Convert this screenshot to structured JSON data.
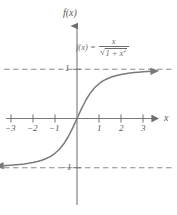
{
  "figure": {
    "title": "",
    "function_label": "f(x)",
    "x_axis_label": "x",
    "formula": {
      "lhs": "f(x) =",
      "numerator": "x",
      "radical_sign": "√",
      "radicand": "1 + x",
      "radicand_exponent": "2"
    },
    "colors": {
      "curve": "#7a7a7d",
      "axis": "#7a7a7d",
      "asymptote": "#8a8a8d",
      "text": "#58585a",
      "formula_text": "#6d6d70",
      "background": "#ffffff"
    }
  },
  "chart_data": {
    "type": "line",
    "title": "",
    "subtitle": "",
    "xlabel": "x",
    "ylabel": "f(x)",
    "equation": "f(x) = x / sqrt(1 + x^2)",
    "xlim": [
      -3.6,
      3.6
    ],
    "ylim": [
      -2.2,
      2.2
    ],
    "grid": false,
    "legend": null,
    "x_ticks": [
      -3,
      -2,
      -1,
      1,
      2,
      3
    ],
    "x_tick_labels": [
      "−3",
      "−2",
      "−1",
      "1",
      "2",
      "3"
    ],
    "y_ticks": [
      1,
      -1
    ],
    "y_tick_labels": [
      "1",
      "−1"
    ],
    "asymptotes": [
      {
        "type": "horizontal",
        "value": 1,
        "label": "1",
        "style": "dashed"
      },
      {
        "type": "horizontal",
        "value": -1,
        "label": "−1",
        "style": "dashed"
      }
    ],
    "series": [
      {
        "name": "f(x) = x / sqrt(1 + x^2)",
        "style": "solid",
        "x": [
          -3.4,
          -3.2,
          -3.0,
          -2.8,
          -2.6,
          -2.4,
          -2.2,
          -2.0,
          -1.8,
          -1.6,
          -1.4,
          -1.2,
          -1.0,
          -0.8,
          -0.6,
          -0.4,
          -0.2,
          0.0,
          0.2,
          0.4,
          0.6,
          0.8,
          1.0,
          1.2,
          1.4,
          1.6,
          1.8,
          2.0,
          2.2,
          2.4,
          2.6,
          2.8,
          3.0,
          3.2,
          3.4
        ],
        "y": [
          -0.9594,
          -0.9545,
          -0.9487,
          -0.9417,
          -0.9333,
          -0.9231,
          -0.9104,
          -0.8944,
          -0.8742,
          -0.848,
          -0.8137,
          -0.7682,
          -0.7071,
          -0.6247,
          -0.5145,
          -0.3714,
          -0.1961,
          0.0,
          0.1961,
          0.3714,
          0.5145,
          0.6247,
          0.7071,
          0.7682,
          0.8137,
          0.848,
          0.8742,
          0.8944,
          0.9104,
          0.9231,
          0.9333,
          0.9417,
          0.9487,
          0.9545,
          0.9594
        ]
      }
    ]
  }
}
